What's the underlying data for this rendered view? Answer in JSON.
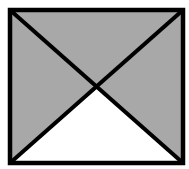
{
  "diagram": {
    "shape": "rectangle-with-diagonals",
    "colors": {
      "background": "#ffffff",
      "fill_shaded": "#a8a8a8",
      "fill_unshaded": "#ffffff",
      "stroke": "#000000"
    },
    "rectangle": {
      "x1": 10,
      "y1": 10,
      "x2": 183,
      "y2": 163
    },
    "intersection": {
      "x": 98,
      "y": 88
    },
    "regions": [
      {
        "name": "top-triangle",
        "shaded": true
      },
      {
        "name": "left-triangle",
        "shaded": true
      },
      {
        "name": "right-triangle",
        "shaded": true
      },
      {
        "name": "bottom-triangle",
        "shaded": false
      }
    ]
  }
}
